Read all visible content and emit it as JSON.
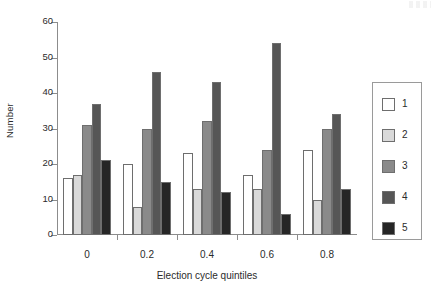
{
  "chart_data": {
    "type": "bar",
    "title": "",
    "xlabel": "Election cycle quintiles",
    "ylabel": "Number",
    "categories": [
      "0",
      "0.2",
      "0.4",
      "0.6",
      "0.8"
    ],
    "ylim": [
      0,
      60
    ],
    "yticks": [
      0,
      10,
      20,
      30,
      40,
      50,
      60
    ],
    "ytick_labels": [
      "0",
      "10",
      "20",
      "30",
      "40",
      "50",
      "60"
    ],
    "grid": false,
    "legend_position": "right",
    "series": [
      {
        "name": "1",
        "color": "#ffffff",
        "values": [
          16,
          20,
          23,
          17,
          24
        ]
      },
      {
        "name": "2",
        "color": "#d9d9d9",
        "values": [
          17,
          8,
          13,
          13,
          10
        ]
      },
      {
        "name": "3",
        "color": "#8a8a8a",
        "values": [
          31,
          30,
          32,
          24,
          30
        ]
      },
      {
        "name": "4",
        "color": "#565656",
        "values": [
          37,
          46,
          43,
          54,
          34
        ]
      },
      {
        "name": "5",
        "color": "#262626",
        "values": [
          21,
          15,
          12,
          6,
          13
        ]
      }
    ]
  },
  "axes": {
    "y_title": "Number",
    "x_title": "Election cycle quintiles"
  },
  "legend": {
    "entries": [
      {
        "label": "1"
      },
      {
        "label": "2"
      },
      {
        "label": "3"
      },
      {
        "label": "4"
      },
      {
        "label": "5"
      }
    ]
  },
  "colors": {
    "axis": "#8c8c8c",
    "bar_outline": "#6e6e6e",
    "text": "#2b2b2b",
    "background": "#ffffff"
  }
}
